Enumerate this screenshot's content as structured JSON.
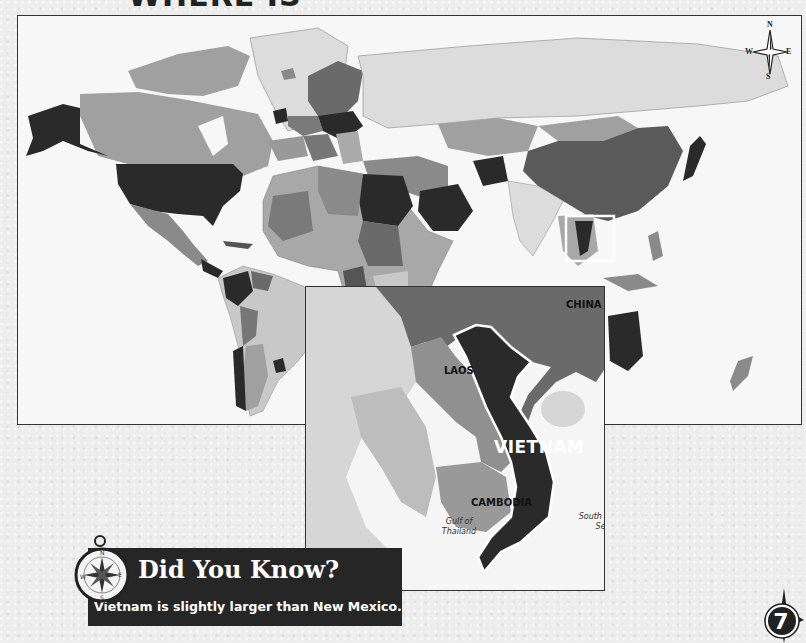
{
  "page": {
    "title_fragment": "WHERE IS",
    "page_number": "7"
  },
  "world_map": {
    "compass": {
      "n": "N",
      "s": "S",
      "e": "E",
      "w": "W"
    },
    "highlight_region": "Southeast Asia (Vietnam)"
  },
  "inset_map": {
    "labels": {
      "china": "CHINA",
      "laos": "LAOS",
      "vietnam": "VIETNAM",
      "cambodia": "CAMBODIA"
    },
    "water_labels": {
      "gulf_line1": "Gulf of",
      "gulf_line2": "Thailand",
      "sea_line1": "South China",
      "sea_line2": "Sea"
    }
  },
  "did_you_know": {
    "title": "Did You Know?",
    "text": "Vietnam is slightly larger than New Mexico.",
    "compass_letters": {
      "n": "N",
      "s": "S",
      "e": "E",
      "w": "W"
    }
  },
  "colors": {
    "dark_country": "#2a2a2a",
    "mid_country": "#7a7a7a",
    "light_country": "#a8a8a8",
    "pale_country": "#d4d4d4",
    "ocean": "#f7f7f7",
    "banner": "#262626"
  }
}
